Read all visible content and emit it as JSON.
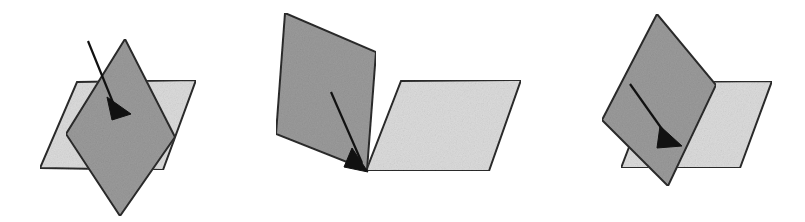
{
  "figure": {
    "background_color": "#ffffff",
    "width": 805,
    "height": 222,
    "colors": {
      "plane_dark_fill": "#9b9b9b",
      "plane_light_fill": "#dcdcdc",
      "outline": "#2b2b2b",
      "arrow": "#111111"
    },
    "panels": [
      {
        "name": "left-panel",
        "label": "Panel A",
        "description": "Two planes crossing at a steep angle, arrow piercing the dark plane",
        "light_plane": {
          "name": "light-plane",
          "points": "77,82 196,80 163,170 40,168"
        },
        "dark_plane": {
          "name": "dark-plane",
          "points": "125,39 175,137 120,216 66,134"
        },
        "arrow": {
          "name": "arrow",
          "shaft": "88,41 116,110",
          "head": "107,97 131,114 112,120"
        }
      },
      {
        "name": "middle-panel",
        "label": "Panel B",
        "description": "Two planes hinged along a common edge forming an open book, arrow pointing to the hinge",
        "light_plane": {
          "name": "light-plane",
          "points": "401,81 521,80 489,171 366,171"
        },
        "dark_plane": {
          "name": "dark-plane",
          "points": "285,13 376,52 367,170 276,134"
        },
        "arrow": {
          "name": "arrow",
          "shaft": "331,92 362,163",
          "head": "352,148 368,172 344,167"
        }
      },
      {
        "name": "right-panel",
        "label": "Panel C",
        "description": "Two planes intersecting at an oblique angle, arrow crossing the dark plane",
        "light_plane": {
          "name": "light-plane",
          "points": "654,82 772,81 740,168 621,168"
        },
        "dark_plane": {
          "name": "dark-plane",
          "points": "657,14 716,85 668,186 602,120"
        },
        "arrow": {
          "name": "arrow",
          "shaft": "630,84 669,139",
          "head": "660,126 682,146 657,148"
        }
      }
    ]
  }
}
